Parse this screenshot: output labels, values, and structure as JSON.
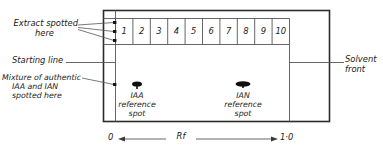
{
  "figure": {
    "title_none": "",
    "annotations": {
      "extract_spotted": {
        "line1": "Extract spotted",
        "line2": "here"
      },
      "starting_line": "Starting line",
      "mixture": {
        "line1": "Mixture of authentic",
        "line2": "IAA and IAN",
        "line3": "spotted here"
      },
      "solvent_front": {
        "line1": "Solvent",
        "line2": "front"
      }
    },
    "chromatogram": {
      "lane_numbers": [
        "1",
        "2",
        "3",
        "4",
        "5",
        "6",
        "7",
        "8",
        "9",
        "10"
      ],
      "spots": [
        {
          "name": "IAA reference spot",
          "label_line1": "IAA",
          "label_line2": "reference",
          "label_line3": "spot"
        },
        {
          "name": "IAN reference spot",
          "label_line1": "IAN",
          "label_line2": "reference",
          "label_line3": "spot"
        }
      ],
      "spot_color": "#101010"
    },
    "axis": {
      "start_label": "0",
      "name_label": "Rf",
      "end_label": "1·0"
    },
    "colors": {
      "ink": "#1a1a1a",
      "line": "#2b2b2b",
      "paper": "#ffffff"
    }
  }
}
